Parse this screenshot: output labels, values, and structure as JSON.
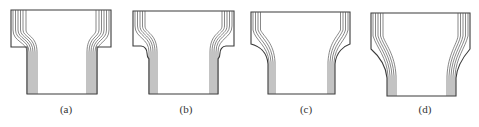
{
  "figure": {
    "panels": [
      {
        "id": "a",
        "label": "(a)",
        "label_x": 66
      },
      {
        "id": "b",
        "label": "(b)",
        "label_x": 186
      },
      {
        "id": "c",
        "label": "(c)",
        "label_x": 306
      },
      {
        "id": "d",
        "label": "(d)",
        "label_x": 425
      }
    ],
    "colors": {
      "outline": "#3a3a3a",
      "flow_lines": "#555555",
      "background": "#ffffff"
    },
    "flow_line_count": 6
  }
}
